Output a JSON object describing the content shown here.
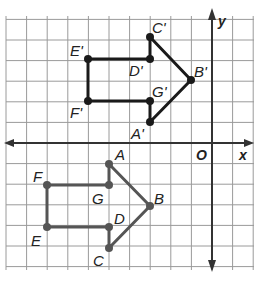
{
  "grid": {
    "origin_px": [
      212,
      143
    ],
    "unit_px": 20.6,
    "x_range": [
      -10,
      2
    ],
    "y_range": [
      -6,
      6
    ],
    "grid_color": "#9a9a9a",
    "axis_color": "#333333"
  },
  "axes": {
    "x_label": "x",
    "y_label": "y",
    "origin_label": "O"
  },
  "figures": {
    "image": {
      "name": "A'B'C'D'E'F'G'",
      "color": "#1a1a1a",
      "vertices": [
        {
          "label": "A'",
          "x": -3,
          "y": 1
        },
        {
          "label": "B'",
          "x": -1,
          "y": 3
        },
        {
          "label": "C'",
          "x": -3,
          "y": 5
        },
        {
          "label": "D'",
          "x": -3,
          "y": 4
        },
        {
          "label": "E'",
          "x": -6,
          "y": 4
        },
        {
          "label": "F'",
          "x": -6,
          "y": 2
        },
        {
          "label": "G'",
          "x": -3,
          "y": 2
        }
      ]
    },
    "preimage": {
      "name": "ABCDEFG",
      "color": "#555555",
      "vertices": [
        {
          "label": "A",
          "x": -5,
          "y": -1
        },
        {
          "label": "B",
          "x": -3,
          "y": -3
        },
        {
          "label": "C",
          "x": -5,
          "y": -5
        },
        {
          "label": "D",
          "x": -5,
          "y": -4
        },
        {
          "label": "E",
          "x": -8,
          "y": -4
        },
        {
          "label": "F",
          "x": -8,
          "y": -2
        },
        {
          "label": "G",
          "x": -5,
          "y": -2
        }
      ]
    }
  },
  "labels": {
    "A_prime": "A'",
    "B_prime": "B'",
    "C_prime": "C'",
    "D_prime": "D'",
    "E_prime": "E'",
    "F_prime": "F'",
    "G_prime": "G'",
    "A": "A",
    "B": "B",
    "C": "C",
    "D": "D",
    "E": "E",
    "F": "F",
    "G": "G"
  }
}
